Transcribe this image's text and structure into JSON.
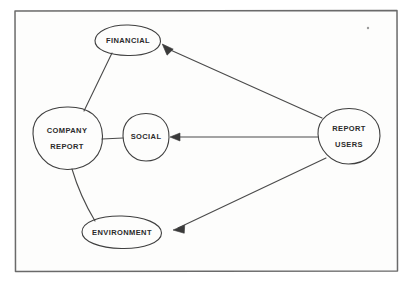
{
  "canvas": {
    "width": 414,
    "height": 287,
    "background_color": "#fdfdfc",
    "paper_color": "#fefefe",
    "ink_color": "#3a3a3a",
    "frame_color": "#555555"
  },
  "frame": {
    "name": "paper-border",
    "x": 14,
    "y": 10,
    "width": 384,
    "height": 262
  },
  "diagram": {
    "type": "concept-map",
    "nodes": [
      {
        "id": "financial",
        "label": "FINANCIAL",
        "lines": [
          "FINANCIAL"
        ],
        "shape": "ellipse",
        "cx": 128,
        "cy": 40,
        "rx": 33,
        "ry": 15,
        "font_size": 7.5
      },
      {
        "id": "company-report",
        "label": "COMPANY REPORT",
        "lines": [
          "COMPANY",
          "REPORT"
        ],
        "shape": "ellipse",
        "cx": 67,
        "cy": 138,
        "rx": 35,
        "ry": 31,
        "font_size": 7.5
      },
      {
        "id": "social",
        "label": "SOCIAL",
        "lines": [
          "SOCIAL"
        ],
        "shape": "ellipse",
        "cx": 146,
        "cy": 137,
        "rx": 23,
        "ry": 24,
        "font_size": 7.5
      },
      {
        "id": "environment",
        "label": "ENVIRONMENT",
        "lines": [
          "ENVIRONMENT"
        ],
        "shape": "ellipse",
        "cx": 122,
        "cy": 232,
        "rx": 40,
        "ry": 16,
        "font_size": 7.5
      },
      {
        "id": "report-users",
        "label": "REPORT USERS",
        "lines": [
          "REPORT",
          "USERS"
        ],
        "shape": "ellipse",
        "cx": 349,
        "cy": 136,
        "rx": 31,
        "ry": 28,
        "font_size": 7.5
      }
    ],
    "edges": [
      {
        "id": "company-report-to-financial",
        "from": "company-report",
        "to": "financial",
        "arrow": false,
        "style": "plain-line"
      },
      {
        "id": "company-report-to-social",
        "from": "company-report",
        "to": "social",
        "arrow": false,
        "style": "plain-line"
      },
      {
        "id": "company-report-to-environment",
        "from": "company-report",
        "to": "environment",
        "arrow": false,
        "style": "plain-line"
      },
      {
        "id": "report-users-to-financial",
        "from": "report-users",
        "to": "financial",
        "arrow": true,
        "style": "arrow-line"
      },
      {
        "id": "report-users-to-social",
        "from": "report-users",
        "to": "social",
        "arrow": true,
        "style": "arrow-line"
      },
      {
        "id": "report-users-to-environment",
        "from": "report-users",
        "to": "environment",
        "arrow": true,
        "style": "arrow-line"
      }
    ]
  },
  "marks": {
    "stray_speck": {
      "cx": 368,
      "cy": 28,
      "r": 1.2
    }
  }
}
